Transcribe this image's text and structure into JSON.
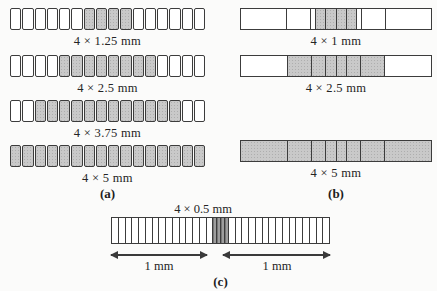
{
  "figure": {
    "description_colors": {
      "shaded_fill": "#c9c9c9",
      "dark_fill": "#8a8a8a",
      "unshaded_fill": "#ffffff",
      "line": "#3c3c3c"
    },
    "panels": {
      "a": {
        "caption": "(a)",
        "rows": [
          {
            "label": "4 × 1.25 mm",
            "cells": [
              {
                "n": 6,
                "w": 1.25,
                "f": "u"
              },
              {
                "n": 4,
                "w": 1.25,
                "f": "s"
              },
              {
                "n": 6,
                "w": 1.25,
                "f": "u"
              }
            ]
          },
          {
            "label": "4 × 2.5 mm",
            "cells": [
              {
                "n": 4,
                "w": 1.25,
                "f": "u"
              },
              {
                "n": 8,
                "w": 1.25,
                "f": "s"
              },
              {
                "n": 4,
                "w": 1.25,
                "f": "u"
              }
            ]
          },
          {
            "label": "4 × 3.75 mm",
            "cells": [
              {
                "n": 2,
                "w": 1.25,
                "f": "u"
              },
              {
                "n": 12,
                "w": 1.25,
                "f": "s"
              },
              {
                "n": 2,
                "w": 1.25,
                "f": "u"
              }
            ]
          },
          {
            "label": "4 × 5 mm",
            "cells": [
              {
                "n": 16,
                "w": 1.25,
                "f": "s"
              }
            ]
          }
        ]
      },
      "b": {
        "caption": "(b)",
        "rows": [
          {
            "label": "4 × 1 mm",
            "cells": [
              {
                "w": 5,
                "f": "u"
              },
              {
                "w": 2.5,
                "f": "u"
              },
              {
                "w": 0.5,
                "f": "u"
              },
              {
                "n": 4,
                "w": 1,
                "f": "s"
              },
              {
                "w": 0.5,
                "f": "u"
              },
              {
                "w": 2.5,
                "f": "u"
              },
              {
                "w": 5,
                "f": "u"
              }
            ]
          },
          {
            "label": "4 × 2.5 mm",
            "cells": [
              {
                "w": 5,
                "f": "u"
              },
              {
                "w": 2.5,
                "f": "s"
              },
              {
                "w": 1.5,
                "f": "s"
              },
              {
                "n": 2,
                "w": 1,
                "f": "s"
              },
              {
                "w": 1.5,
                "f": "s"
              },
              {
                "w": 2.5,
                "f": "s"
              },
              {
                "w": 5,
                "f": "u"
              }
            ]
          },
          {
            "label": "4 × 5 mm",
            "cells": [
              {
                "w": 5,
                "f": "s"
              },
              {
                "w": 2.5,
                "f": "s"
              },
              {
                "w": 1.5,
                "f": "s"
              },
              {
                "n": 2,
                "w": 1,
                "f": "s"
              },
              {
                "w": 1.5,
                "f": "s"
              },
              {
                "w": 2.5,
                "f": "s"
              },
              {
                "w": 5,
                "f": "s"
              }
            ]
          }
        ]
      },
      "c": {
        "caption": "(c)",
        "top_label": "4 × 0.5 mm",
        "arrow_left_label": "1 mm",
        "arrow_right_label": "1 mm",
        "row": {
          "cells": [
            {
              "n": 15,
              "w": 1,
              "f": "u"
            },
            {
              "n": 4,
              "w": 0.5,
              "f": "d"
            },
            {
              "n": 15,
              "w": 1,
              "f": "u"
            }
          ]
        }
      }
    }
  }
}
